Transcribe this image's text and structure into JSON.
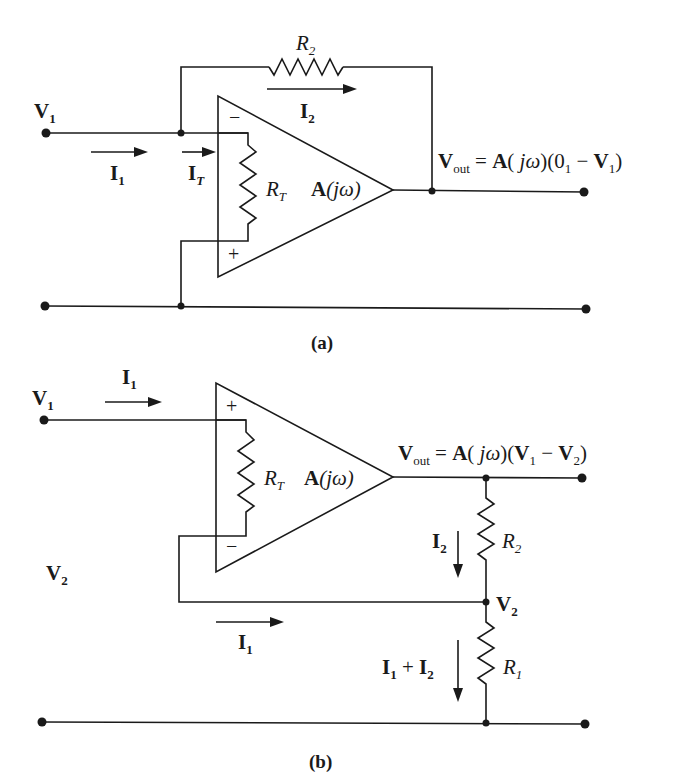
{
  "figure": {
    "top_cut_text": "…g, y, … (t) … … … … … g … p … y …",
    "panel_a": {
      "caption": "(a)",
      "input_node": {
        "label": "V",
        "sub": "1"
      },
      "feedback_resistor": {
        "label": "R",
        "sub": "2"
      },
      "feedback_current": {
        "label": "I",
        "sub": "2"
      },
      "input_current": {
        "label": "I",
        "sub": "1"
      },
      "terminal_current": {
        "label": "I",
        "sub": "T"
      },
      "internal_resistor": {
        "label": "R",
        "sub": "T"
      },
      "amplifier_gain": "A(jω)",
      "inverting_sign": "−",
      "noninverting_sign": "+",
      "output_equation": {
        "lhs": "V",
        "lhs_sub": "out",
        "eq": " = ",
        "gain": "A( jω)",
        "paren_open": "(0",
        "zero_sub": "1",
        "minus": " − ",
        "v": "V",
        "v_sub": "1",
        "paren_close": ")"
      }
    },
    "panel_b": {
      "caption": "(b)",
      "input_node": {
        "label": "V",
        "sub": "1"
      },
      "input_current": {
        "label": "I",
        "sub": "1"
      },
      "internal_resistor": {
        "label": "R",
        "sub": "T"
      },
      "amplifier_gain": "A(jω)",
      "noninverting_sign": "+",
      "inverting_sign": "−",
      "feedback_node_left": {
        "label": "V",
        "sub": "2"
      },
      "feedback_node_right": {
        "label": "V",
        "sub": "2"
      },
      "return_current": {
        "label": "I",
        "sub": "1"
      },
      "r2_current": {
        "label": "I",
        "sub": "2"
      },
      "r2": {
        "label": "R",
        "sub": "2"
      },
      "r1": {
        "label": "R",
        "sub": "1"
      },
      "r1_current": {
        "a": "I",
        "a_sub": "1",
        "plus": " + ",
        "b": "I",
        "b_sub": "2"
      },
      "output_equation": {
        "lhs": "V",
        "lhs_sub": "out",
        "eq": " = ",
        "gain": "A( jω)",
        "paren_open": "(",
        "v1": "V",
        "v1_sub": "1",
        "minus": " − ",
        "v2": "V",
        "v2_sub": "2",
        "paren_close": ")"
      }
    }
  }
}
